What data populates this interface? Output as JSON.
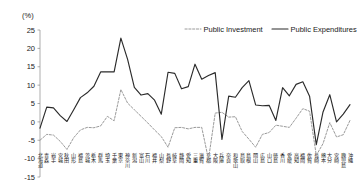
{
  "chart_data": {
    "type": "line",
    "title": "",
    "xlabel": "",
    "ylabel": "(%)",
    "ylim": [
      -15,
      25
    ],
    "yticks": [
      25,
      20,
      15,
      10,
      5,
      0,
      -5,
      -10,
      -15
    ],
    "ytick_labels": [
      "25",
      "20",
      "15",
      "10",
      "5",
      "0",
      "-5",
      "-10",
      "-15"
    ],
    "grid": false,
    "legend_position": "top-right",
    "categories": [
      "北海道",
      "青森",
      "岩手",
      "宮城",
      "秋田",
      "山形",
      "福島",
      "茨城",
      "栃木",
      "群馬",
      "埼玉",
      "千葉",
      "東京",
      "神奈川",
      "新潟",
      "富山",
      "石川",
      "福井",
      "山梨",
      "長野",
      "岐阜",
      "静岡",
      "愛知",
      "三重",
      "滋賀",
      "京都",
      "大阪",
      "兵庫",
      "奈良",
      "和歌山",
      "鳥取",
      "島根",
      "岡山",
      "広島",
      "山口",
      "徳島",
      "香川",
      "愛媛",
      "高知",
      "福岡",
      "佐賀",
      "長崎",
      "熊本",
      "大分",
      "宮崎",
      "鹿児島",
      "沖縄"
    ],
    "series": [
      {
        "name": "Public Investment",
        "style": "dashed",
        "color": "#9a9a9a",
        "values": [
          -5.0,
          -3.4,
          -3.6,
          -5.3,
          -7.5,
          -4.3,
          -2.2,
          -1.5,
          -1.6,
          -1.1,
          1.5,
          0.3,
          8.8,
          5.1,
          3.3,
          1.5,
          -0.3,
          -2.2,
          -4.0,
          -6.9,
          -1.6,
          -1.5,
          -1.9,
          -1.5,
          -1.5,
          -10.2,
          2.4,
          2.6,
          1.3,
          1.4,
          -2.6,
          -4.7,
          -6.9,
          -3.4,
          -2.9,
          -0.9,
          -1.2,
          -1.5,
          1.0,
          3.6,
          2.9,
          -9.1,
          -5.9,
          -0.2,
          -4.1,
          -3.5,
          0.4
        ]
      },
      {
        "name": "Public Expenditures",
        "style": "solid",
        "color": "#2b2b2b",
        "values": [
          -1.7,
          4.0,
          3.8,
          1.7,
          0.1,
          3.3,
          6.6,
          7.9,
          9.7,
          13.6,
          13.6,
          13.6,
          22.8,
          17.0,
          9.4,
          7.3,
          7.7,
          5.9,
          2.1,
          13.5,
          13.2,
          9.0,
          9.6,
          15.7,
          11.6,
          12.6,
          13.4,
          -4.8,
          7.0,
          6.7,
          9.3,
          11.2,
          4.6,
          4.4,
          4.5,
          0.4,
          9.3,
          7.1,
          10.2,
          10.9,
          7.0,
          -6.2,
          2.7,
          7.4,
          0.0,
          2.1,
          4.7
        ]
      }
    ]
  }
}
